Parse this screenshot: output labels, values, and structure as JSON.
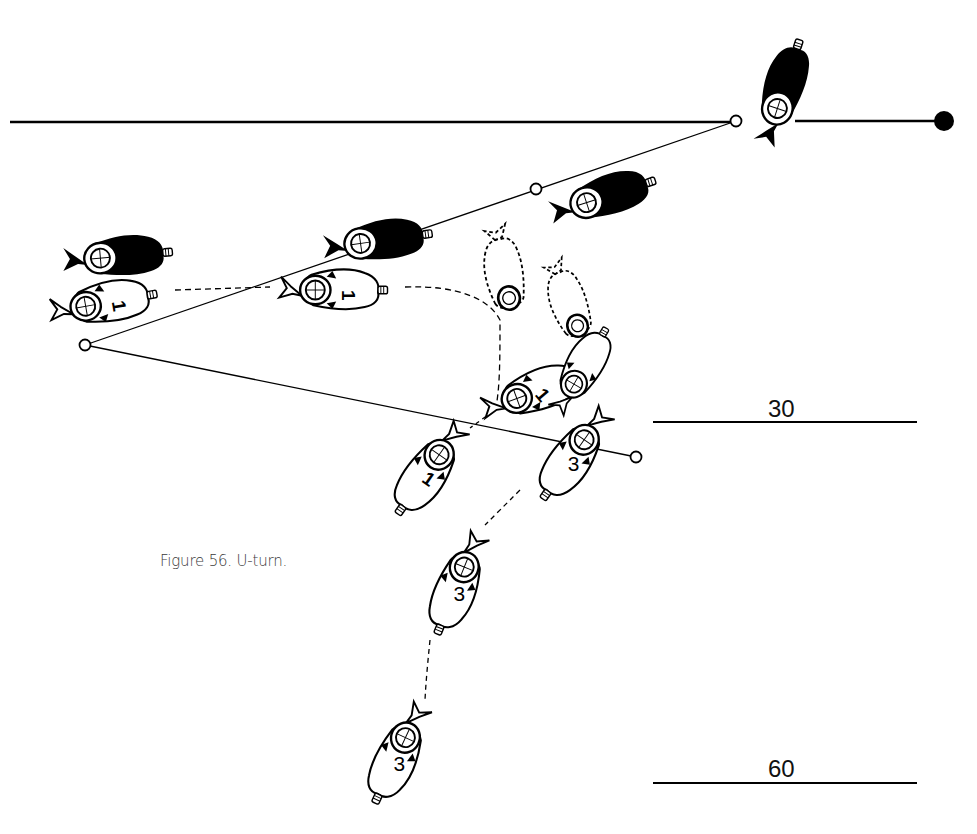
{
  "figure": {
    "caption": "Figure 56. U-turn.",
    "scale_labels": {
      "first": "30",
      "second": "60"
    },
    "colors": {
      "ink": "#000000",
      "background": "#ffffff",
      "caption": "#3a3a3a"
    }
  },
  "divers": {
    "leader_marker": "1",
    "follower_marker": "3",
    "leader_positions": [
      "start",
      "mid",
      "turning",
      "turned",
      "return"
    ],
    "follower_positions": [
      "turned",
      "descending",
      "return"
    ]
  },
  "waypoints": {
    "count": 4,
    "end_marker": "filled"
  }
}
